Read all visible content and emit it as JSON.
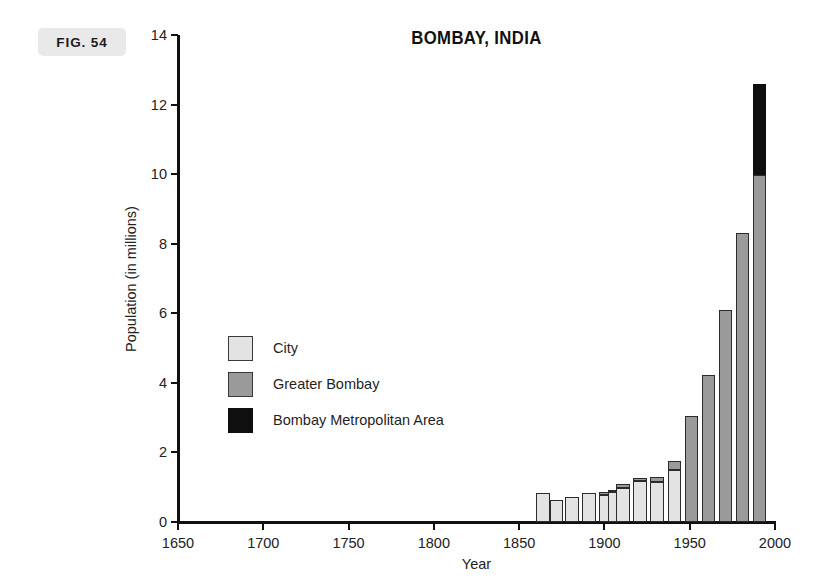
{
  "figure": {
    "label": "FIG. 54"
  },
  "chart_data": {
    "type": "bar",
    "stacked": true,
    "title": "BOMBAY, INDIA",
    "xlabel": "Year",
    "ylabel": "Population (in millions)",
    "xlim": [
      1650,
      2000
    ],
    "ylim": [
      0,
      14
    ],
    "xticks": [
      1650,
      1700,
      1750,
      1800,
      1850,
      1900,
      1950,
      2000
    ],
    "xtick_labels": [
      "1650",
      "1700",
      "1750",
      "1800",
      "1850",
      "1900",
      "1950",
      "2000"
    ],
    "yticks": [
      0,
      2,
      4,
      6,
      8,
      10,
      12,
      14
    ],
    "ytick_labels": [
      "0",
      "2",
      "4",
      "6",
      "8",
      "10",
      "12",
      "14"
    ],
    "grid": false,
    "legend_position": "center-left",
    "bar_width_years": 8,
    "categories": [
      1864,
      1872,
      1881,
      1891,
      1901,
      1906,
      1911,
      1921,
      1931,
      1941,
      1951,
      1961,
      1971,
      1981,
      1991
    ],
    "series": [
      {
        "name": "City",
        "color": "#e3e3e3",
        "values": [
          0.82,
          0.64,
          0.73,
          0.82,
          0.78,
          0.85,
          0.98,
          1.18,
          1.16,
          1.49,
          0.0,
          0.0,
          0.0,
          0.0,
          0.0
        ]
      },
      {
        "name": "Greater Bombay",
        "color": "#9a9a9a",
        "values": [
          0.0,
          0.0,
          0.0,
          0.0,
          0.09,
          0.08,
          0.12,
          0.08,
          0.12,
          0.25,
          3.05,
          4.22,
          6.1,
          8.32,
          9.98
        ]
      },
      {
        "name": "Bombay Metropolitan Area",
        "color": "#100f0f",
        "values": [
          0.0,
          0.0,
          0.0,
          0.0,
          0.0,
          0.0,
          0.0,
          0.0,
          0.0,
          0.0,
          0.0,
          0.0,
          0.0,
          0.0,
          2.62
        ]
      }
    ],
    "legend": [
      {
        "label": "City",
        "swatch": "city"
      },
      {
        "label": "Greater Bombay",
        "swatch": "greater"
      },
      {
        "label": "Bombay Metropolitan Area",
        "swatch": "metro"
      }
    ]
  }
}
